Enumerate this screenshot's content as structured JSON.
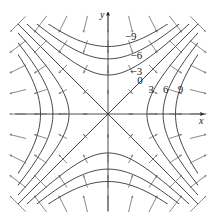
{
  "chart_data": {
    "type": "contour",
    "title": "",
    "function": "f(x,y) = x^2 - y^2",
    "xlabel": "x",
    "ylabel": "y",
    "xlim": [
      -4,
      4
    ],
    "ylim": [
      -4,
      4
    ],
    "grid": false,
    "levels": [
      -9,
      -6,
      -3,
      0,
      3,
      6,
      9
    ],
    "level_labels": [
      {
        "text": "-9",
        "x": 0.75,
        "y": 3.3
      },
      {
        "text": "-6",
        "x": 1.0,
        "y": 2.45
      },
      {
        "text": "-3",
        "x": 1.0,
        "y": 1.75
      },
      {
        "text": "0",
        "x": 1.3,
        "y": 1.35
      },
      {
        "text": "3",
        "x": 1.8,
        "y": 0.95
      },
      {
        "text": "6",
        "x": 2.45,
        "y": 0.95
      },
      {
        "text": "9",
        "x": 3.1,
        "y": 0.95
      }
    ],
    "vector_field": "grad f = (2x, -2y)",
    "vector_grid_spacing": 1
  },
  "colors": {
    "line": "#333333",
    "arrow": "#555555",
    "background": "#ffffff"
  },
  "layout": {
    "origin_px": [
      108,
      114
    ],
    "unit_px": 22.5
  }
}
